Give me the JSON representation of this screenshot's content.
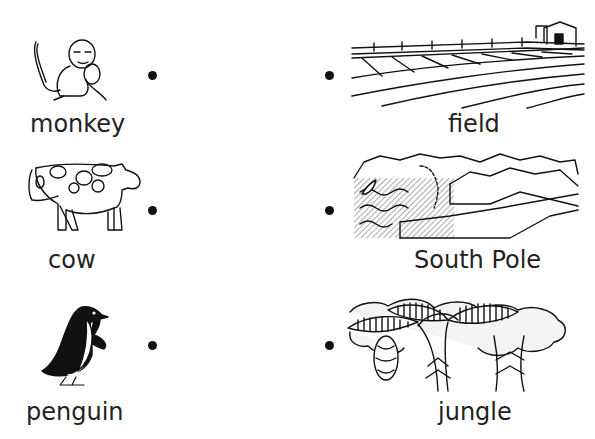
{
  "worksheet": {
    "left_column": [
      {
        "label": "monkey",
        "icon": "monkey-icon"
      },
      {
        "label": "cow",
        "icon": "cow-icon"
      },
      {
        "label": "penguin",
        "icon": "penguin-icon"
      }
    ],
    "right_column": [
      {
        "label": "field",
        "icon": "field-icon"
      },
      {
        "label": "South Pole",
        "icon": "south-pole-icon"
      },
      {
        "label": "jungle",
        "icon": "jungle-icon"
      }
    ]
  }
}
